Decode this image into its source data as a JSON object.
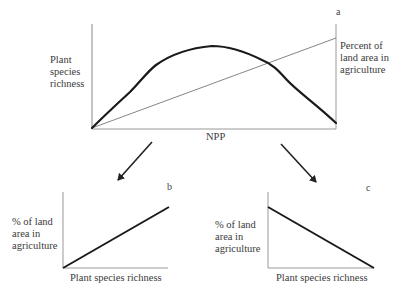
{
  "panels": {
    "a": {
      "letter": "a",
      "y_label_left": "Plant\nspecies\nrichness",
      "y_label_right": "Percent of\nland area in\nagriculture",
      "x_label": "NPP",
      "series": [
        {
          "name": "Plant species richness",
          "style": "thick",
          "shape": "hump"
        },
        {
          "name": "Percent of land area in agriculture",
          "style": "thin",
          "shape": "increasing"
        }
      ]
    },
    "b": {
      "letter": "b",
      "y_label": "% of land\narea in\nagriculture",
      "x_label": "Plant species richness",
      "relationship": "positive"
    },
    "c": {
      "letter": "c",
      "y_label": "% of land\narea in\nagriculture",
      "x_label": "Plant species richness",
      "relationship": "negative"
    }
  },
  "arrows": [
    {
      "from": "a",
      "to": "b",
      "direction": "down-left"
    },
    {
      "from": "a",
      "to": "c",
      "direction": "down-right"
    }
  ],
  "colors": {
    "axis": "#888888",
    "curve": "#1a1a1a",
    "thin_line": "#666666",
    "text": "#3a3a3a"
  }
}
